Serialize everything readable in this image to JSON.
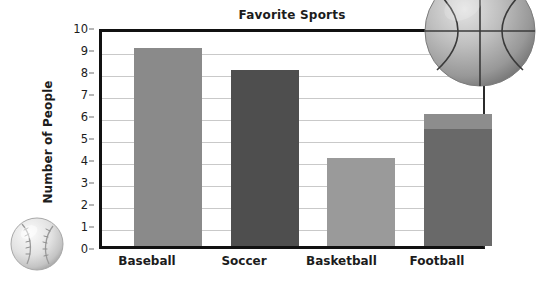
{
  "chart_data": {
    "type": "bar",
    "title": "Favorite Sports",
    "xlabel": "",
    "ylabel": "Number of People",
    "categories": [
      "Baseball",
      "Soccer",
      "Basketball",
      "Football"
    ],
    "values": [
      9,
      8,
      4,
      6
    ],
    "ylim": [
      0,
      10
    ],
    "ytick_labels": [
      "0",
      "1",
      "2",
      "3",
      "4",
      "5",
      "6",
      "7",
      "8",
      "9",
      "10"
    ],
    "ytick_values": [
      0,
      1,
      2,
      3,
      4,
      5,
      6,
      7,
      8,
      9,
      10
    ],
    "grid": "horizontal",
    "legend": "none",
    "bar_colors": [
      "#8a8a8a",
      "#4e4e4e",
      "#9a9a9a",
      "#696969"
    ],
    "series": [
      {
        "name": "Number of People",
        "values": [
          9,
          8,
          4,
          6
        ]
      }
    ],
    "annotations": [
      {
        "name": "football-bar-light-cap",
        "category": "Football",
        "from_value": 5.3,
        "to_value": 6,
        "color": "#8d8d8d"
      }
    ]
  },
  "decorations": {
    "basketball_label": "basketball-illustration",
    "baseball_label": "baseball-illustration"
  },
  "colors": {
    "axis": "#111111",
    "gridline": "#c9c9c9",
    "text": "#1c1c1c",
    "background": "#ffffff"
  }
}
